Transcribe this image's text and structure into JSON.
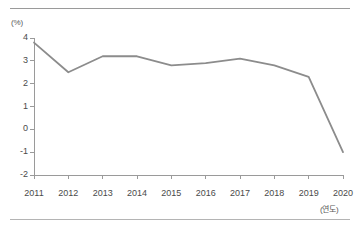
{
  "chart_data": {
    "type": "line",
    "title": "",
    "xlabel": "(연도)",
    "ylabel": "(%)",
    "categories": [
      "2011",
      "2012",
      "2013",
      "2014",
      "2015",
      "2016",
      "2017",
      "2018",
      "2019",
      "2020"
    ],
    "x": [
      2011,
      2012,
      2013,
      2014,
      2015,
      2016,
      2017,
      2018,
      2019,
      2020
    ],
    "values": [
      3.8,
      2.5,
      3.2,
      3.2,
      2.8,
      2.9,
      3.1,
      2.8,
      2.3,
      -1.0
    ],
    "series": [
      {
        "name": "",
        "values": [
          3.8,
          2.5,
          3.2,
          3.2,
          2.8,
          2.9,
          3.1,
          2.8,
          2.3,
          -1.0
        ]
      }
    ],
    "ylim": [
      -2,
      4
    ],
    "xlim": [
      2011,
      2020
    ],
    "yticks": [
      4,
      3,
      2,
      1,
      0,
      -1,
      -2
    ],
    "ytick_labels": [
      "4",
      "3",
      "2",
      "1",
      "0",
      "-1",
      "-2"
    ],
    "xticks": [
      2011,
      2012,
      2013,
      2014,
      2015,
      2016,
      2017,
      2018,
      2019,
      2020
    ],
    "grid": false,
    "legend": "none",
    "line_color": "#8c8c8c",
    "axis_color": "#9a9a9a",
    "tick_text_color": "#4a4a4a"
  },
  "decorations": {
    "top_rule_color": "#9a9a9a",
    "bottom_rule_color": "#b4b4b4"
  }
}
